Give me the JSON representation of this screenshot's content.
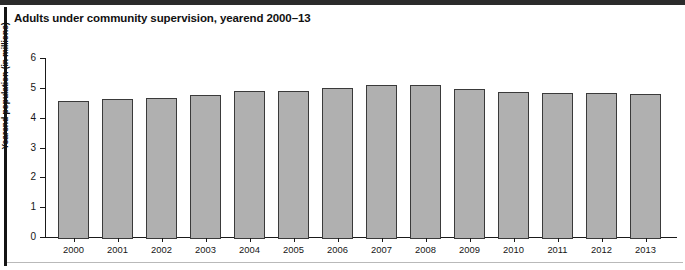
{
  "figure": {
    "title": "Adults under community supervision, yearend 2000–13"
  },
  "chart_data": {
    "type": "bar",
    "title": "Adults under community supervision, yearend 2000–13",
    "xlabel": "",
    "ylabel": "Yearend population (in millions)",
    "categories": [
      "2000",
      "2001",
      "2002",
      "2003",
      "2004",
      "2005",
      "2006",
      "2007",
      "2008",
      "2009",
      "2010",
      "2011",
      "2012",
      "2013"
    ],
    "values": [
      4.62,
      4.69,
      4.73,
      4.83,
      4.97,
      4.97,
      5.07,
      5.17,
      5.17,
      5.03,
      4.93,
      4.9,
      4.9,
      4.86
    ],
    "ylim": [
      0,
      6
    ],
    "yticks": [
      0,
      1,
      2,
      3,
      4,
      5,
      6
    ],
    "ytick_labels": [
      "0",
      "1",
      "2",
      "3",
      "4",
      "5",
      "6"
    ],
    "grid": false,
    "legend": null,
    "bar_color": "#b0b0b0",
    "bar_edge_color": "#3a3a3a",
    "axis_color": "#1a1a1a"
  }
}
